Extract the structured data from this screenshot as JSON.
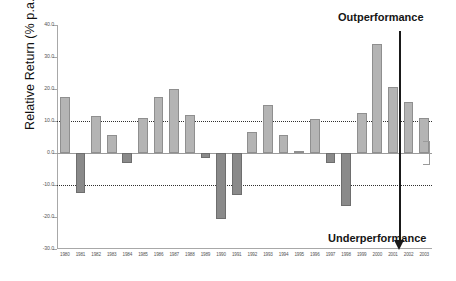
{
  "chart_data": {
    "type": "bar",
    "title": "",
    "xlabel": "",
    "ylabel": "Relative Return (% p.a.)",
    "ylim": [
      -30,
      40
    ],
    "yticks": [
      40.0,
      30.0,
      20.0,
      10.0,
      0.0,
      -10.0,
      -20.0,
      -30.0
    ],
    "ytick_labels": [
      "40.0",
      "30.0",
      "20.0",
      "10.0",
      "0.0",
      "-10.0",
      "-20.0",
      "-30.0"
    ],
    "grid": false,
    "legend_position": "none",
    "reference_lines": [
      {
        "value": 10.0,
        "style": "dotted"
      },
      {
        "value": 0.0,
        "style": "solid"
      },
      {
        "value": -10.0,
        "style": "dotted"
      }
    ],
    "categories": [
      "1980",
      "1981",
      "1982",
      "1983",
      "1984",
      "1985",
      "1986",
      "1987",
      "1988",
      "1989",
      "1990",
      "1991",
      "1992",
      "1993",
      "1994",
      "1995",
      "1996",
      "1997",
      "1998",
      "1999",
      "2000",
      "2001",
      "2002",
      "2003"
    ],
    "values": [
      17.5,
      -12.5,
      11.5,
      5.5,
      -3.0,
      11.0,
      17.5,
      20.0,
      12.0,
      -1.5,
      -20.5,
      -13.0,
      6.5,
      15.0,
      5.5,
      0.5,
      10.5,
      -3.0,
      -16.5,
      12.5,
      34.0,
      20.5,
      16.0,
      11.0
    ],
    "colors": {
      "positive_fill": "#b4b4b4",
      "positive_stroke": "#8f8f8f",
      "negative_fill": "#8a8a8a",
      "negative_stroke": "#6e6e6e",
      "axis": "#a8a8a8",
      "annotation": "#1a1a1a"
    },
    "annotations": [
      {
        "name": "outperformance",
        "text": "Outperformance",
        "position": "top-right"
      },
      {
        "name": "underperformance",
        "text": "Underperformance",
        "position": "bottom-right"
      }
    ]
  }
}
